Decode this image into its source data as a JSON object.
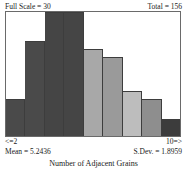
{
  "header": {
    "full_scale_label": "Full Scale = 30",
    "total_label": "Total = 156"
  },
  "axis": {
    "left_label": "<=2",
    "right_label": "10=>"
  },
  "stats": {
    "mean_label": "Mean = 5.2436",
    "sdev_label": "S.Dev. = 1.8959"
  },
  "caption": {
    "text": "Number of Adjacent Grains"
  },
  "chart_data": {
    "type": "bar",
    "title": "Number of Adjacent Grains",
    "xlabel": "Number of Adjacent Grains",
    "ylabel": "",
    "ylim": [
      0,
      30
    ],
    "grid": false,
    "legend": "none",
    "full_scale": 30,
    "total": 156,
    "mean": 5.2436,
    "sdev": 1.8959,
    "categories": [
      "<=2",
      "3",
      "4",
      "5",
      "6",
      "7",
      "8",
      "9",
      "10=>"
    ],
    "values": [
      9,
      23,
      30,
      30,
      21,
      19,
      11,
      9,
      4
    ],
    "bar_colors": [
      "#4a4a4a",
      "#4a4a4a",
      "#454545",
      "#454545",
      "#a8a8a8",
      "#9a9a9a",
      "#bdbdbd",
      "#8e8e8e",
      "#3c3c3c"
    ]
  }
}
